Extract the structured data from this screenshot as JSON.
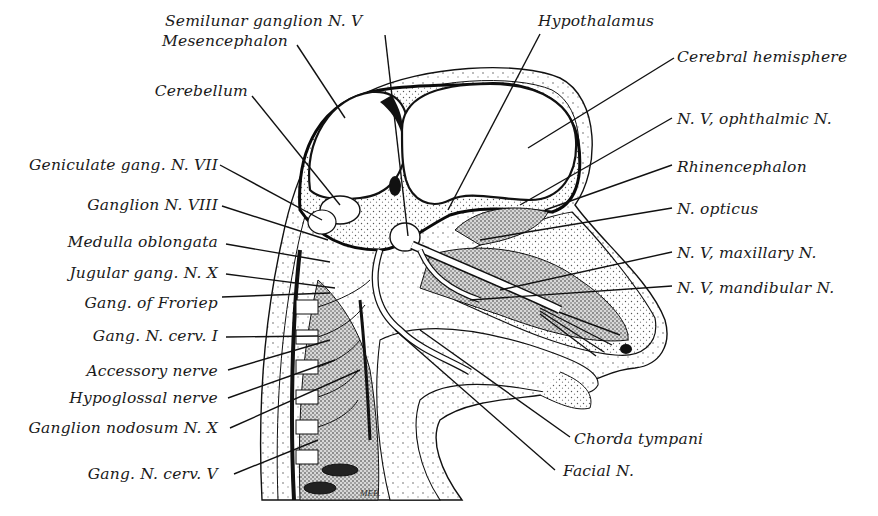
{
  "figure": {
    "signature": "MEB.",
    "colors": {
      "ink": "#111111",
      "paper": "#ffffff",
      "stipple": "#9a9a9a"
    }
  },
  "labels": {
    "left": [
      {
        "id": "cerebellum",
        "text": "Cerebellum"
      },
      {
        "id": "geniculate",
        "text": "Geniculate gang. N. VII"
      },
      {
        "id": "ganglion_viii",
        "text": "Ganglion N. VIII"
      },
      {
        "id": "medulla",
        "text": "Medulla oblongata"
      },
      {
        "id": "jugular",
        "text": "Jugular gang. N. X"
      },
      {
        "id": "froriep",
        "text": "Gang. of Froriep"
      },
      {
        "id": "cerv_i",
        "text": "Gang. N. cerv. I"
      },
      {
        "id": "accessory",
        "text": "Accessory nerve"
      },
      {
        "id": "hypoglossal",
        "text": "Hypoglossal nerve"
      },
      {
        "id": "nodosum",
        "text": "Ganglion nodosum N. X"
      },
      {
        "id": "cerv_v",
        "text": "Gang. N. cerv. V"
      }
    ],
    "top": [
      {
        "id": "semilunar",
        "text": "Semilunar ganglion N. V"
      },
      {
        "id": "mesencephalon",
        "text": "Mesencephalon"
      },
      {
        "id": "hypothalamus",
        "text": "Hypothalamus"
      }
    ],
    "right": [
      {
        "id": "cerebral_hemisphere",
        "text": "Cerebral hemisphere"
      },
      {
        "id": "ophthalmic",
        "text": "N. V, ophthalmic N."
      },
      {
        "id": "rhinencephalon",
        "text": "Rhinencephalon"
      },
      {
        "id": "opticus",
        "text": "N. opticus"
      },
      {
        "id": "maxillary",
        "text": "N. V, maxillary N."
      },
      {
        "id": "mandibular",
        "text": "N. V, mandibular N."
      }
    ],
    "bottom": [
      {
        "id": "chorda",
        "text": "Chorda tympani"
      },
      {
        "id": "facial",
        "text": "Facial N."
      }
    ]
  }
}
